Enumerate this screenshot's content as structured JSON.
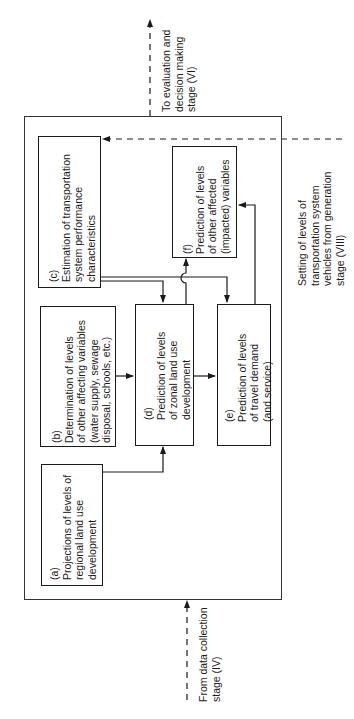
{
  "diagram": {
    "orientation": "rotated-90-ccw",
    "external": {
      "top_output": {
        "lines": [
          "To evaluation and",
          "decision making",
          "stage (VI)"
        ]
      },
      "bottom_input": {
        "lines": [
          "From data collection",
          "stage (IV)"
        ]
      },
      "right_input": {
        "lines": [
          "Setting of levels of",
          "transportation system",
          "vehicles from generation",
          "stage (VIII)"
        ]
      }
    },
    "boxes": {
      "a": {
        "tag": "(a)",
        "lines": [
          "Projections of levels of",
          "regional land use",
          "development"
        ]
      },
      "b": {
        "tag": "(b)",
        "lines": [
          "Determination of levels",
          "of other affecting variables",
          "(water supply, sewage",
          "disposal, schools, etc.)"
        ]
      },
      "c": {
        "tag": "(c)",
        "lines": [
          "Estimation of transportation",
          "system performance",
          "characteristics"
        ]
      },
      "d": {
        "tag": "(d)",
        "lines": [
          "Prediction of levels",
          "of zonal land use",
          "development"
        ]
      },
      "e": {
        "tag": "(e)",
        "lines": [
          "Prediction of levels",
          "of travel demand",
          "(and service)"
        ]
      },
      "f": {
        "tag": "(f)",
        "lines": [
          "Prediction of levels",
          "of other affected",
          "(impacted) variables"
        ]
      }
    },
    "connections": [
      {
        "from": "a",
        "to": "d"
      },
      {
        "from": "b",
        "to": "d"
      },
      {
        "from": "c",
        "to": "d"
      },
      {
        "from": "c",
        "to": "e"
      },
      {
        "from": "d",
        "to": "e"
      },
      {
        "from": "d",
        "to": "f"
      },
      {
        "from": "e",
        "to": "f"
      },
      {
        "from": "right_input",
        "to": "c",
        "style": "dashed"
      },
      {
        "from": "bottom_input",
        "to": "outer",
        "style": "dashed"
      },
      {
        "from": "outer",
        "to": "top_output",
        "style": "dashed"
      }
    ],
    "colors": {
      "line": "#1a1a1a",
      "background": "#ffffff"
    }
  }
}
